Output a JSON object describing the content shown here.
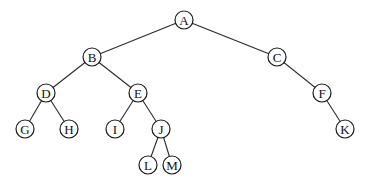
{
  "diagram": {
    "type": "binary-tree",
    "node_radius": 9,
    "colors": {
      "edge": "#2a2a2a",
      "node_stroke": "#1a1a1a",
      "node_fill": "#ffffff",
      "label": "#111111"
    },
    "nodes": [
      {
        "id": "A",
        "label": "A",
        "x": 184,
        "y": 20
      },
      {
        "id": "B",
        "label": "B",
        "x": 92,
        "y": 57
      },
      {
        "id": "C",
        "label": "C",
        "x": 277,
        "y": 57
      },
      {
        "id": "D",
        "label": "D",
        "x": 46,
        "y": 93
      },
      {
        "id": "E",
        "label": "E",
        "x": 138,
        "y": 93
      },
      {
        "id": "F",
        "label": "F",
        "x": 322,
        "y": 93
      },
      {
        "id": "G",
        "label": "G",
        "x": 25,
        "y": 129
      },
      {
        "id": "H",
        "label": "H",
        "x": 69,
        "y": 129
      },
      {
        "id": "I",
        "label": "I",
        "x": 115,
        "y": 129
      },
      {
        "id": "J",
        "label": "J",
        "x": 161,
        "y": 129
      },
      {
        "id": "K",
        "label": "K",
        "x": 345,
        "y": 129
      },
      {
        "id": "L",
        "label": "L",
        "x": 148,
        "y": 165
      },
      {
        "id": "M",
        "label": "M",
        "x": 172,
        "y": 165
      }
    ],
    "edges": [
      {
        "from": "A",
        "to": "B"
      },
      {
        "from": "A",
        "to": "C"
      },
      {
        "from": "B",
        "to": "D"
      },
      {
        "from": "B",
        "to": "E"
      },
      {
        "from": "C",
        "to": "F"
      },
      {
        "from": "D",
        "to": "G"
      },
      {
        "from": "D",
        "to": "H"
      },
      {
        "from": "E",
        "to": "I"
      },
      {
        "from": "E",
        "to": "J"
      },
      {
        "from": "F",
        "to": "K"
      },
      {
        "from": "J",
        "to": "L"
      },
      {
        "from": "J",
        "to": "M"
      }
    ]
  }
}
